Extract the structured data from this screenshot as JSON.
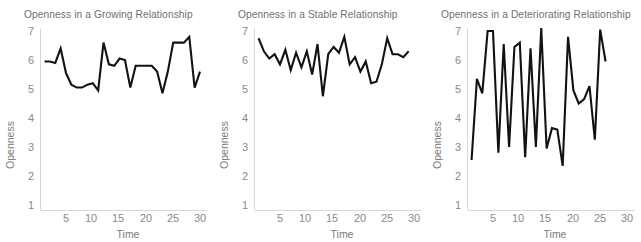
{
  "figure": {
    "background": "#ffffff",
    "line_color": "#121212",
    "text_color": "#7a7a7a",
    "axis_color": "#d8d8d8"
  },
  "chart_data": [
    {
      "type": "line",
      "title": "Openness in a Growing Relationship",
      "xlabel": "Time",
      "ylabel": "Openness",
      "xlim": [
        1,
        31
      ],
      "ylim": [
        1,
        7
      ],
      "xticks": [
        5,
        10,
        15,
        20,
        25,
        30
      ],
      "yticks": [
        1,
        2,
        3,
        4,
        5,
        6,
        7
      ],
      "grid": false,
      "legend": "none",
      "x": [
        1,
        2,
        3,
        4,
        5,
        6,
        7,
        8,
        9,
        10,
        11,
        12,
        13,
        14,
        15,
        16,
        17,
        18,
        19,
        20,
        21,
        22,
        23,
        24,
        25,
        26,
        27,
        28,
        29
      ],
      "values": [
        5.95,
        5.95,
        5.9,
        6.4,
        5.55,
        5.15,
        5.05,
        5.05,
        5.15,
        5.2,
        4.95,
        6.6,
        5.85,
        5.8,
        6.05,
        6.0,
        5.05,
        5.8,
        5.8,
        5.8,
        5.8,
        5.6,
        4.85,
        5.6,
        6.6,
        6.6,
        6.6,
        6.8,
        5.05,
        5.6
      ]
    },
    {
      "type": "line",
      "title": "Openness in a Stable Relationship",
      "xlabel": "Time",
      "ylabel": "Openness",
      "xlim": [
        1,
        31
      ],
      "ylim": [
        1,
        7
      ],
      "xticks": [
        5,
        10,
        15,
        20,
        25,
        30
      ],
      "yticks": [
        1,
        2,
        3,
        4,
        5,
        6,
        7
      ],
      "grid": false,
      "legend": "none",
      "x": [
        1,
        2,
        3,
        4,
        5,
        6,
        7,
        8,
        9,
        10,
        11,
        12,
        13,
        14,
        15,
        16,
        17,
        18,
        19,
        20,
        21,
        22,
        23,
        24,
        25,
        26,
        27,
        28
      ],
      "values": [
        6.75,
        6.3,
        6.05,
        6.2,
        5.85,
        6.35,
        5.65,
        6.25,
        5.75,
        6.3,
        5.5,
        6.55,
        4.75,
        6.2,
        6.45,
        6.25,
        6.8,
        5.85,
        6.1,
        5.6,
        5.95,
        5.2,
        5.25,
        5.85,
        6.75,
        6.2,
        6.2,
        6.1,
        6.3
      ]
    },
    {
      "type": "line",
      "title": "Openness in a Deteriorating Relationship",
      "xlabel": "Time",
      "ylabel": "Openness",
      "xlim": [
        1,
        31
      ],
      "ylim": [
        1,
        7
      ],
      "xticks": [
        5,
        10,
        15,
        20,
        25,
        30
      ],
      "yticks": [
        1,
        2,
        3,
        4,
        5,
        6,
        7
      ],
      "grid": false,
      "legend": "none",
      "x": [
        1,
        2,
        3,
        4,
        5,
        6,
        7,
        8,
        9,
        10,
        11,
        12,
        13,
        14,
        15,
        16,
        17,
        18,
        19,
        20,
        21,
        22,
        23,
        24,
        25,
        26,
        27,
        28
      ],
      "values": [
        2.55,
        5.35,
        4.85,
        7.0,
        7.0,
        2.8,
        6.55,
        3.0,
        6.45,
        6.6,
        2.65,
        6.4,
        3.0,
        7.1,
        2.95,
        3.65,
        3.6,
        2.35,
        6.8,
        4.95,
        4.5,
        4.65,
        5.1,
        3.25,
        7.05,
        5.95
      ]
    }
  ]
}
